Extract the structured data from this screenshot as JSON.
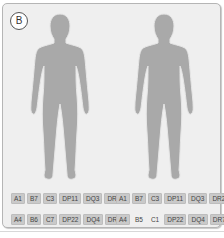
{
  "panel": {
    "label": "B",
    "colors": {
      "background": "#efefef",
      "figure": "#a9a9a9",
      "tag_background": "#c9c9c9"
    }
  },
  "figures": [
    {
      "name": "left",
      "tags_row1": [
        {
          "text": "A1",
          "highlighted": true
        },
        {
          "text": "B7",
          "highlighted": true
        },
        {
          "text": "C3",
          "highlighted": true
        },
        {
          "text": "DP11",
          "highlighted": true
        },
        {
          "text": "DQ3",
          "highlighted": true
        },
        {
          "text": "DR2",
          "highlighted": true
        }
      ],
      "tags_row2": [
        {
          "text": "A4",
          "highlighted": true
        },
        {
          "text": "B6",
          "highlighted": true
        },
        {
          "text": "C7",
          "highlighted": true
        },
        {
          "text": "DP22",
          "highlighted": true
        },
        {
          "text": "DQ4",
          "highlighted": true
        },
        {
          "text": "DR7",
          "highlighted": true
        }
      ]
    },
    {
      "name": "right",
      "tags_row1": [
        {
          "text": "A1",
          "highlighted": true
        },
        {
          "text": "B7",
          "highlighted": true
        },
        {
          "text": "C3",
          "highlighted": true
        },
        {
          "text": "DP11",
          "highlighted": true
        },
        {
          "text": "DQ3",
          "highlighted": true
        },
        {
          "text": "DR2",
          "highlighted": true
        }
      ],
      "tags_row2": [
        {
          "text": "A4",
          "highlighted": true
        },
        {
          "text": "B5",
          "highlighted": false
        },
        {
          "text": "C1",
          "highlighted": false
        },
        {
          "text": "DP22",
          "highlighted": true
        },
        {
          "text": "DQ4",
          "highlighted": true
        },
        {
          "text": "DR7",
          "highlighted": true
        }
      ]
    }
  ]
}
